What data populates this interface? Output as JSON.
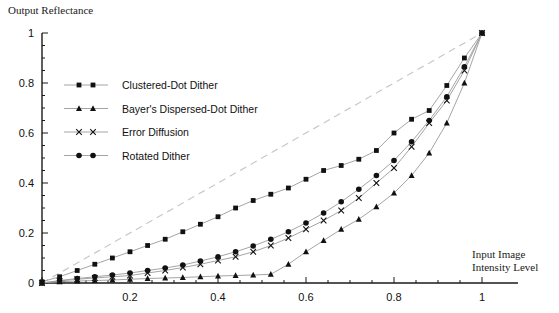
{
  "chart_data": {
    "type": "line",
    "title": "",
    "ylabel": "Output Reflectance",
    "xlabel": "Input Image Intensity Level",
    "xlim": [
      0,
      1
    ],
    "ylim": [
      0,
      1
    ],
    "grid": false,
    "legend_position": "upper-left-inside",
    "x_ticks": [
      "0.2",
      "0.4",
      "0.6",
      "0.8",
      "1"
    ],
    "x_tick_values": [
      0.2,
      0.4,
      0.6,
      0.8,
      1
    ],
    "y_ticks": [
      "0",
      "0.2",
      "0.4",
      "0.6",
      "0.8",
      "1"
    ],
    "y_tick_values": [
      0,
      0.2,
      0.4,
      0.6,
      0.8,
      1
    ],
    "minor_tick_step": 0.05,
    "reference_line": {
      "name": "ideal-linear-reference",
      "style": "dashed",
      "color": "#c8c8c8",
      "from": [
        0,
        0
      ],
      "to": [
        1,
        1
      ]
    },
    "series": [
      {
        "name": "Clustered-Dot Dither",
        "marker": "square",
        "color": "#111111",
        "x": [
          0.0,
          0.04,
          0.08,
          0.12,
          0.16,
          0.2,
          0.24,
          0.28,
          0.32,
          0.36,
          0.4,
          0.44,
          0.48,
          0.52,
          0.56,
          0.6,
          0.64,
          0.68,
          0.72,
          0.76,
          0.8,
          0.84,
          0.88,
          0.92,
          0.96,
          1.0
        ],
        "y": [
          0.005,
          0.025,
          0.05,
          0.075,
          0.1,
          0.125,
          0.15,
          0.175,
          0.205,
          0.235,
          0.265,
          0.3,
          0.33,
          0.355,
          0.38,
          0.415,
          0.45,
          0.47,
          0.495,
          0.53,
          0.6,
          0.655,
          0.69,
          0.79,
          0.9,
          1.0
        ]
      },
      {
        "name": "Bayer's Dispersed-Dot Dither",
        "marker": "triangle",
        "color": "#111111",
        "x": [
          0.0,
          0.04,
          0.08,
          0.12,
          0.16,
          0.2,
          0.24,
          0.28,
          0.32,
          0.36,
          0.4,
          0.44,
          0.48,
          0.52,
          0.56,
          0.6,
          0.64,
          0.68,
          0.72,
          0.76,
          0.8,
          0.84,
          0.88,
          0.92,
          0.96,
          1.0
        ],
        "y": [
          0.0,
          0.005,
          0.008,
          0.01,
          0.012,
          0.015,
          0.018,
          0.02,
          0.022,
          0.025,
          0.028,
          0.03,
          0.032,
          0.035,
          0.075,
          0.125,
          0.17,
          0.215,
          0.255,
          0.305,
          0.36,
          0.43,
          0.52,
          0.64,
          0.8,
          1.0
        ]
      },
      {
        "name": "Error Diffusion",
        "marker": "cross",
        "color": "#111111",
        "x": [
          0.0,
          0.04,
          0.08,
          0.12,
          0.16,
          0.2,
          0.24,
          0.28,
          0.32,
          0.36,
          0.4,
          0.44,
          0.48,
          0.52,
          0.56,
          0.6,
          0.64,
          0.68,
          0.72,
          0.76,
          0.8,
          0.84,
          0.88,
          0.92,
          0.96,
          1.0
        ],
        "y": [
          0.0,
          0.008,
          0.015,
          0.02,
          0.025,
          0.03,
          0.04,
          0.05,
          0.062,
          0.075,
          0.09,
          0.105,
          0.125,
          0.15,
          0.18,
          0.215,
          0.25,
          0.29,
          0.34,
          0.4,
          0.46,
          0.545,
          0.64,
          0.73,
          0.85,
          1.0
        ]
      },
      {
        "name": "Rotated Dither",
        "marker": "circle",
        "color": "#111111",
        "x": [
          0.0,
          0.04,
          0.08,
          0.12,
          0.16,
          0.2,
          0.24,
          0.28,
          0.32,
          0.36,
          0.4,
          0.44,
          0.48,
          0.52,
          0.56,
          0.6,
          0.64,
          0.68,
          0.72,
          0.76,
          0.8,
          0.84,
          0.88,
          0.92,
          0.96,
          1.0
        ],
        "y": [
          0.0,
          0.01,
          0.018,
          0.025,
          0.032,
          0.04,
          0.05,
          0.06,
          0.072,
          0.088,
          0.105,
          0.125,
          0.148,
          0.175,
          0.205,
          0.24,
          0.28,
          0.325,
          0.375,
          0.43,
          0.49,
          0.565,
          0.65,
          0.745,
          0.865,
          1.0
        ]
      }
    ]
  },
  "legend": {
    "items": [
      {
        "label": "Clustered-Dot Dither",
        "marker": "square"
      },
      {
        "label": "Bayer's Dispersed-Dot Dither",
        "marker": "triangle"
      },
      {
        "label": "Error Diffusion",
        "marker": "cross"
      },
      {
        "label": "Rotated Dither",
        "marker": "circle"
      }
    ]
  },
  "axis_titles": {
    "y": "Output Reflectance",
    "x_line1": "Input Image",
    "x_line2": "Intensity Level"
  }
}
